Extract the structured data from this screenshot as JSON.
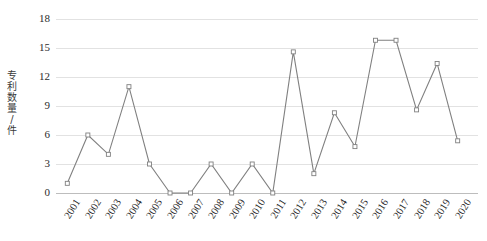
{
  "chart_data": {
    "type": "line",
    "title": "",
    "subtitle": "",
    "xlabel": "",
    "ylabel": "专利数量/件",
    "categories": [
      "2001",
      "2002",
      "2003",
      "2004",
      "2005",
      "2006",
      "2007",
      "2008",
      "2009",
      "2010",
      "2011",
      "2012",
      "2013",
      "2014",
      "2015",
      "2016",
      "2017",
      "2018",
      "2019",
      "2020"
    ],
    "values": [
      1,
      6,
      4,
      11,
      3,
      0,
      0,
      3,
      0,
      3,
      0,
      14.6,
      2,
      8.3,
      4.8,
      15.8,
      15.8,
      8.6,
      13.4,
      5.4
    ],
    "series": [
      {
        "name": "专利数量/件",
        "values": [
          1,
          6,
          4,
          11,
          3,
          0,
          0,
          3,
          0,
          3,
          0,
          14.6,
          2,
          8.3,
          4.8,
          15.8,
          15.8,
          8.6,
          13.4,
          5.4
        ]
      }
    ],
    "ylim": [
      0,
      18
    ],
    "yticks": [
      0,
      3,
      6,
      9,
      12,
      15,
      18
    ],
    "ytick_labels": [
      "0",
      "3",
      "6",
      "9",
      "12",
      "15",
      "18"
    ],
    "grid": true,
    "grid_axis": "y",
    "legend": false,
    "legend_position": "none",
    "marker": "open-square",
    "line_color": "#808080",
    "marker_color": "#808080",
    "grid_color": "#e2e2e2",
    "axis_color": "#bdbdbd",
    "text_color": "#1f1f1f",
    "background": "#ffffff"
  }
}
